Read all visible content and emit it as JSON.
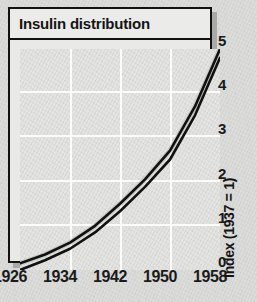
{
  "chart": {
    "title": "Insulin distribution"
  },
  "chart_data": {
    "type": "line",
    "title": "Insulin distribution",
    "xlabel": "",
    "ylabel": "Index (1937 = 1)",
    "xlim": [
      1926,
      1958
    ],
    "ylim": [
      0,
      5
    ],
    "grid": true,
    "legend": false,
    "x_ticks": [
      "1926",
      "1934",
      "1942",
      "1950",
      "1958"
    ],
    "y_ticks": [
      "0",
      "1",
      "2",
      "3",
      "4",
      "5"
    ],
    "x": [
      1926,
      1930,
      1934,
      1938,
      1942,
      1946,
      1950,
      1954,
      1958
    ],
    "series": [
      {
        "name": "upper bound",
        "values": [
          0.15,
          0.35,
          0.62,
          1.0,
          1.5,
          2.05,
          2.7,
          3.7,
          5.0
        ]
      },
      {
        "name": "lower bound",
        "values": [
          0.0,
          0.22,
          0.48,
          0.85,
          1.33,
          1.88,
          2.5,
          3.5,
          4.8
        ]
      }
    ],
    "annotations": []
  },
  "axes": {
    "y_label": "Index (1937 = 1)",
    "y_ticks": [
      {
        "label": "5",
        "value": 5
      },
      {
        "label": "4",
        "value": 4
      },
      {
        "label": "3",
        "value": 3
      },
      {
        "label": "2",
        "value": 2
      },
      {
        "label": "1",
        "value": 1
      },
      {
        "label": "0",
        "value": 0
      }
    ],
    "x_ticks": [
      {
        "label": "1926",
        "value": 1926
      },
      {
        "label": "1934",
        "value": 1934
      },
      {
        "label": "1942",
        "value": 1942
      },
      {
        "label": "1950",
        "value": 1950
      },
      {
        "label": "1958",
        "value": 1958
      }
    ]
  },
  "colors": {
    "line": "#111111",
    "grid": "#fbfbfa",
    "plot_background": "#e4e4e2",
    "frame_border": "#111111",
    "shadow": "#a9a9a7",
    "page_background": "#dcdcda"
  }
}
